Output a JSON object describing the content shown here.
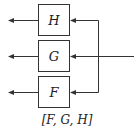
{
  "diagram": {
    "type": "block-diagram",
    "blocks": [
      {
        "id": "H",
        "label": "H"
      },
      {
        "id": "G",
        "label": "G"
      },
      {
        "id": "F",
        "label": "F"
      }
    ],
    "input": "single input line from right, fanned out to H, G, F",
    "outputs": "each block outputs leftward",
    "caption": "[F, G, H]"
  },
  "colors": {
    "stroke": "#333333",
    "background": "#ffffff"
  }
}
